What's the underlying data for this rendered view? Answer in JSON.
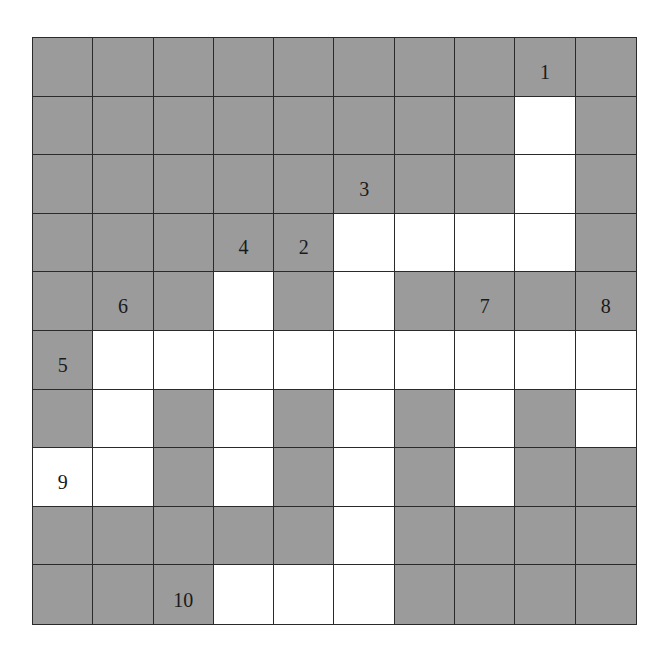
{
  "puzzle": {
    "type": "crossword-grid",
    "rows": 10,
    "cols": 10,
    "colors": {
      "blocked": "#9b9b9b",
      "open": "#ffffff",
      "line": "#2a2a2a"
    },
    "grid": [
      "GGGGGGGGGG",
      "GGGGGGGGWG",
      "GGGGGGGGWG",
      "GGGGGWWWWG",
      "GGGWGWGGGG",
      "GWWWWWWWWW",
      "GWGWGWGWGW",
      "WWGWGWGWGG",
      "GGGGGWGGGG",
      "GGGWWWGGGG"
    ],
    "clue_numbers": [
      {
        "label": "1",
        "row": 0,
        "col": 8
      },
      {
        "label": "2",
        "row": 3,
        "col": 4
      },
      {
        "label": "3",
        "row": 2,
        "col": 5
      },
      {
        "label": "4",
        "row": 3,
        "col": 3
      },
      {
        "label": "5",
        "row": 5,
        "col": 0
      },
      {
        "label": "6",
        "row": 4,
        "col": 1
      },
      {
        "label": "7",
        "row": 4,
        "col": 7
      },
      {
        "label": "8",
        "row": 4,
        "col": 9
      },
      {
        "label": "9",
        "row": 7,
        "col": 0
      },
      {
        "label": "10",
        "row": 9,
        "col": 2
      }
    ]
  },
  "cells": {}
}
